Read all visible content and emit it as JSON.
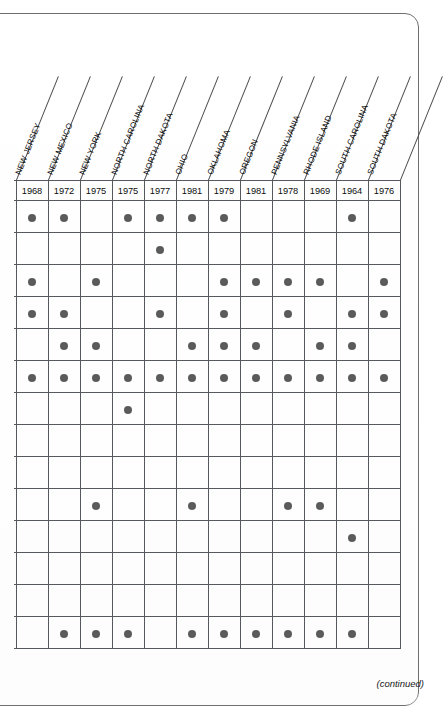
{
  "page": {
    "continued_note": "(continued)"
  },
  "table": {
    "columns": [
      {
        "state": "NEW JERSEY",
        "year": "1968"
      },
      {
        "state": "NEW MEXICO",
        "year": "1972"
      },
      {
        "state": "NEW YORK",
        "year": "1975"
      },
      {
        "state": "NORTH CAROLINA",
        "year": "1975"
      },
      {
        "state": "NORTH DAKOTA",
        "year": "1977"
      },
      {
        "state": "OHIO",
        "year": "1981"
      },
      {
        "state": "OKLAHOMA",
        "year": "1979"
      },
      {
        "state": "OREGON",
        "year": "1981"
      },
      {
        "state": "PENNSYLVANIA",
        "year": "1978"
      },
      {
        "state": "RHODE ISLAND",
        "year": "1969"
      },
      {
        "state": "SOUTH CAROLINA",
        "year": "1964"
      },
      {
        "state": "SOUTH DAKOTA",
        "year": "1976"
      }
    ],
    "rows": [
      {
        "cells": [
          1,
          1,
          0,
          1,
          1,
          1,
          1,
          0,
          0,
          0,
          1,
          0
        ]
      },
      {
        "cells": [
          0,
          0,
          0,
          0,
          1,
          0,
          0,
          0,
          0,
          0,
          0,
          0
        ]
      },
      {
        "cells": [
          1,
          0,
          1,
          0,
          0,
          0,
          1,
          1,
          1,
          1,
          0,
          1
        ]
      },
      {
        "cells": [
          1,
          1,
          0,
          0,
          1,
          0,
          1,
          0,
          1,
          0,
          1,
          1
        ]
      },
      {
        "cells": [
          0,
          1,
          1,
          0,
          0,
          1,
          1,
          1,
          0,
          1,
          1,
          0
        ]
      },
      {
        "cells": [
          1,
          1,
          1,
          1,
          1,
          1,
          1,
          1,
          1,
          1,
          1,
          1
        ]
      },
      {
        "cells": [
          0,
          0,
          0,
          1,
          0,
          0,
          0,
          0,
          0,
          0,
          0,
          0
        ]
      },
      {
        "cells": [
          0,
          0,
          0,
          0,
          0,
          0,
          0,
          0,
          0,
          0,
          0,
          0
        ]
      },
      {
        "cells": [
          0,
          0,
          0,
          0,
          0,
          0,
          0,
          0,
          0,
          0,
          0,
          0
        ]
      },
      {
        "cells": [
          0,
          0,
          1,
          0,
          0,
          1,
          0,
          0,
          1,
          1,
          0,
          0
        ]
      },
      {
        "cells": [
          0,
          0,
          0,
          0,
          0,
          0,
          0,
          0,
          0,
          0,
          1,
          0
        ]
      },
      {
        "cells": [
          0,
          0,
          0,
          0,
          0,
          0,
          0,
          0,
          0,
          0,
          0,
          0
        ]
      },
      {
        "cells": [
          0,
          0,
          0,
          0,
          0,
          0,
          0,
          0,
          0,
          0,
          0,
          0
        ]
      },
      {
        "cells": [
          0,
          1,
          1,
          1,
          0,
          1,
          1,
          1,
          1,
          1,
          1,
          0
        ]
      }
    ]
  },
  "chart_data": {
    "type": "table",
    "title": "",
    "categories": [
      "NEW JERSEY",
      "NEW MEXICO",
      "NEW YORK",
      "NORTH CAROLINA",
      "NORTH DAKOTA",
      "OHIO",
      "OKLAHOMA",
      "OREGON",
      "PENNSYLVANIA",
      "RHODE ISLAND",
      "SOUTH CAROLINA",
      "SOUTH DAKOTA"
    ],
    "column_years": [
      1968,
      1972,
      1975,
      1975,
      1977,
      1981,
      1979,
      1981,
      1978,
      1969,
      1964,
      1976
    ],
    "legend": [
      "● = present"
    ],
    "grid": true,
    "matrix": [
      [
        1,
        1,
        0,
        1,
        1,
        1,
        1,
        0,
        0,
        0,
        1,
        0
      ],
      [
        0,
        0,
        0,
        0,
        1,
        0,
        0,
        0,
        0,
        0,
        0,
        0
      ],
      [
        1,
        0,
        1,
        0,
        0,
        0,
        1,
        1,
        1,
        1,
        0,
        1
      ],
      [
        1,
        1,
        0,
        0,
        1,
        0,
        1,
        0,
        1,
        0,
        1,
        1
      ],
      [
        0,
        1,
        1,
        0,
        0,
        1,
        1,
        1,
        0,
        1,
        1,
        0
      ],
      [
        1,
        1,
        1,
        1,
        1,
        1,
        1,
        1,
        1,
        1,
        1,
        1
      ],
      [
        0,
        0,
        0,
        1,
        0,
        0,
        0,
        0,
        0,
        0,
        0,
        0
      ],
      [
        0,
        0,
        0,
        0,
        0,
        0,
        0,
        0,
        0,
        0,
        0,
        0
      ],
      [
        0,
        0,
        0,
        0,
        0,
        0,
        0,
        0,
        0,
        0,
        0,
        0
      ],
      [
        0,
        0,
        1,
        0,
        0,
        1,
        0,
        0,
        1,
        1,
        0,
        0
      ],
      [
        0,
        0,
        0,
        0,
        0,
        0,
        0,
        0,
        0,
        0,
        1,
        0
      ],
      [
        0,
        0,
        0,
        0,
        0,
        0,
        0,
        0,
        0,
        0,
        0,
        0
      ],
      [
        0,
        0,
        0,
        0,
        0,
        0,
        0,
        0,
        0,
        0,
        0,
        0
      ],
      [
        0,
        1,
        1,
        1,
        0,
        1,
        1,
        1,
        1,
        1,
        1,
        0
      ]
    ],
    "row_totals": [
      7,
      1,
      7,
      7,
      7,
      12,
      1,
      0,
      0,
      4,
      1,
      0,
      0,
      9
    ],
    "column_totals": [
      4,
      5,
      5,
      4,
      4,
      5,
      6,
      4,
      5,
      5,
      6,
      3
    ]
  }
}
